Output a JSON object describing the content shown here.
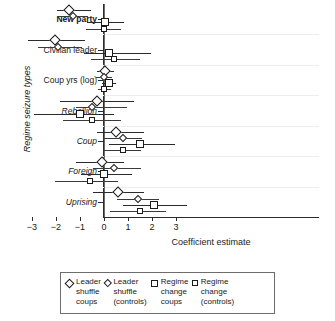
{
  "chart_data": {
    "type": "scatter",
    "title": "",
    "xlabel": "Coefficient estimate",
    "ylabel": "Regime seizure types",
    "xlim": [
      -3.6,
      3.6
    ],
    "xticks": [
      -3,
      -2,
      -1,
      0,
      1,
      2,
      3
    ],
    "xticklabels": [
      "−3",
      "−2",
      "−1",
      "0",
      "1",
      "2",
      "3"
    ],
    "grid": false,
    "zero_reference_line": 0,
    "legend_position": "below",
    "categories": [
      {
        "label": "New party",
        "style": "bold"
      },
      {
        "label": "Civilian leader",
        "style": "normal"
      },
      {
        "label": "Coup yrs (log)",
        "style": "normal"
      },
      {
        "label": "Rebellion",
        "style": "italic"
      },
      {
        "label": "Coup",
        "style": "italic"
      },
      {
        "label": "Foreign",
        "style": "italic"
      },
      {
        "label": "Uprising",
        "style": "italic"
      }
    ],
    "series": [
      {
        "name": "Leader shuffle coups",
        "marker": "diamond",
        "marker_size": "large",
        "estimates": [
          -1.45,
          -2.05,
          0.05,
          -0.3,
          0.5,
          -0.1,
          0.6
        ],
        "ci_low": [
          -1.95,
          -3.15,
          -0.3,
          -1.85,
          -0.3,
          -1.15,
          -0.45
        ],
        "ci_high": [
          -0.55,
          -0.8,
          0.4,
          1.25,
          1.65,
          0.85,
          1.65
        ]
      },
      {
        "name": "Leader shuffle (controls)",
        "marker": "diamond",
        "marker_size": "small",
        "estimates": [
          -1.3,
          -1.9,
          0.0,
          -0.5,
          0.8,
          0.4,
          1.4
        ],
        "ci_low": [
          -1.9,
          -2.75,
          -0.35,
          -1.15,
          -0.05,
          -0.45,
          0.55
        ],
        "ci_high": [
          -0.65,
          -0.9,
          0.35,
          0.95,
          1.6,
          1.55,
          2.3
        ]
      },
      {
        "name": "Regime change coups",
        "marker": "square",
        "marker_size": "large",
        "estimates": [
          0.05,
          0.2,
          0.2,
          -1.0,
          1.5,
          0.0,
          2.1
        ],
        "ci_low": [
          -0.7,
          -0.85,
          -0.1,
          -2.9,
          0.2,
          -0.95,
          0.8
        ],
        "ci_high": [
          0.85,
          1.95,
          0.5,
          0.4,
          2.95,
          1.15,
          3.45
        ]
      },
      {
        "name": "Regime change (controls)",
        "marker": "square",
        "marker_size": "small",
        "estimates": [
          0.0,
          0.4,
          0.0,
          -0.5,
          0.8,
          -0.6,
          1.5
        ],
        "ci_low": [
          -0.75,
          -0.55,
          -0.25,
          -1.7,
          -0.05,
          -2.05,
          0.25
        ],
        "ci_high": [
          0.7,
          1.5,
          0.3,
          0.7,
          1.55,
          0.6,
          2.6
        ]
      }
    ]
  },
  "legend": {
    "items": [
      {
        "marker": "diamond-large",
        "line1": "Leader",
        "line2": "shuffle",
        "line3": "coups"
      },
      {
        "marker": "diamond-small",
        "line1": "Leader",
        "line2": "shuffle",
        "line3": "(controls)"
      },
      {
        "marker": "square-large",
        "line1": "Regime",
        "line2": "change",
        "line3": "coups"
      },
      {
        "marker": "square-small",
        "line1": "Regime",
        "line2": "change",
        "line3": "(controls)"
      }
    ]
  }
}
